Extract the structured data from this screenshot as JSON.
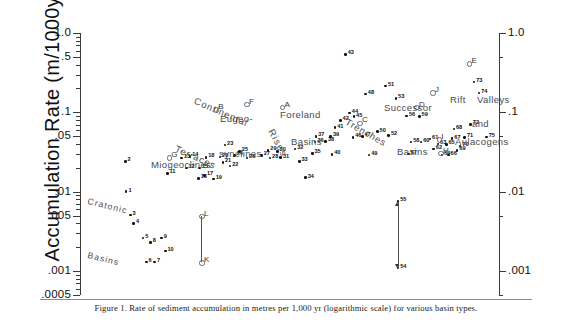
{
  "figure": {
    "caption": "Figure 1. Rate of sediment accumulation in metres per 1,000 yr (logarithmic scale) for various basin types.",
    "ylabel": "Accumulation Rate (m/1000yrs)"
  },
  "chart_data": {
    "type": "scatter",
    "title": "Rate of sediment accumulation in metres per 1,000 yr (logarithmic scale) for various basin types",
    "xlabel": "",
    "ylabel": "Accumulation Rate (m/1000yrs)",
    "yscale": "log",
    "ylim": [
      0.0005,
      1.0
    ],
    "grid": false,
    "legend": "none",
    "xaxis_visible": false,
    "left_axis_ticks": [
      "1.0",
      ".5",
      ".1",
      ".05",
      ".01",
      ".005",
      ".001",
      ".0005"
    ],
    "left_axis_tick_values": [
      1.0,
      0.5,
      0.1,
      0.05,
      0.01,
      0.005,
      0.001,
      0.0005
    ],
    "right_axis_ticks": [
      "1.0",
      ".1",
      ".01",
      ".001"
    ],
    "right_axis_tick_values": [
      1.0,
      0.1,
      0.01,
      0.001
    ],
    "group_labels": [
      {
        "name": "cratonic-basins",
        "text": "Cratonic",
        "text2": "Basins"
      },
      {
        "name": "miogeoclines",
        "text": "Miogeoclines"
      },
      {
        "name": "continental-terraces",
        "text": "Continental",
        "text2": "Terraces"
      },
      {
        "name": "eugeosynclines",
        "text": "Eugeo-",
        "text2": "synclines"
      },
      {
        "name": "rises",
        "text": "Rises"
      },
      {
        "name": "foreland-basins",
        "text": "Foreland",
        "text2": "Basins"
      },
      {
        "name": "trenches",
        "text": "Trenches"
      },
      {
        "name": "successor-basins",
        "text": "Successor",
        "text2": "Basins"
      },
      {
        "name": "rift-valleys-aulacogens",
        "text": "Rift",
        "text2": "Valleys",
        "text3": "and",
        "text4": "Aulacogens"
      }
    ],
    "numbered_points": [
      {
        "id": "1",
        "x": 0.11,
        "y": 0.01
      },
      {
        "id": "2",
        "x": 0.108,
        "y": 0.024
      },
      {
        "id": "3",
        "x": 0.12,
        "y": 0.0051
      },
      {
        "id": "4",
        "x": 0.128,
        "y": 0.004
      },
      {
        "id": "5",
        "x": 0.15,
        "y": 0.0026
      },
      {
        "id": "6",
        "x": 0.158,
        "y": 0.0013
      },
      {
        "id": "7",
        "x": 0.178,
        "y": 0.0013
      },
      {
        "id": "8",
        "x": 0.168,
        "y": 0.0023
      },
      {
        "id": "9",
        "x": 0.194,
        "y": 0.0026
      },
      {
        "id": "10",
        "x": 0.203,
        "y": 0.0018
      },
      {
        "id": "11",
        "x": 0.208,
        "y": 0.017
      },
      {
        "id": "12",
        "x": 0.253,
        "y": 0.02
      },
      {
        "id": "13",
        "x": 0.242,
        "y": 0.0265
      },
      {
        "id": "14",
        "x": 0.262,
        "y": 0.0278
      },
      {
        "id": "15",
        "x": 0.285,
        "y": 0.02
      },
      {
        "id": "16",
        "x": 0.282,
        "y": 0.0148
      },
      {
        "id": "17",
        "x": 0.297,
        "y": 0.016
      },
      {
        "id": "18",
        "x": 0.3,
        "y": 0.0272
      },
      {
        "id": "19",
        "x": 0.318,
        "y": 0.0145
      },
      {
        "id": "20",
        "x": 0.333,
        "y": 0.0275
      },
      {
        "id": "21",
        "x": 0.34,
        "y": 0.0235
      },
      {
        "id": "22",
        "x": 0.357,
        "y": 0.0212
      },
      {
        "id": "23",
        "x": 0.345,
        "y": 0.039
      },
      {
        "id": "24",
        "x": 0.368,
        "y": 0.0285
      },
      {
        "id": "25",
        "x": 0.38,
        "y": 0.032
      },
      {
        "id": "26",
        "x": 0.398,
        "y": 0.0265
      },
      {
        "id": "27",
        "x": 0.432,
        "y": 0.0285
      },
      {
        "id": "28",
        "x": 0.452,
        "y": 0.0265
      },
      {
        "id": "29",
        "x": 0.448,
        "y": 0.033
      },
      {
        "id": "30",
        "x": 0.47,
        "y": 0.032
      },
      {
        "id": "31",
        "x": 0.478,
        "y": 0.0268
      },
      {
        "id": "32",
        "x": 0.512,
        "y": 0.0345
      },
      {
        "id": "33",
        "x": 0.522,
        "y": 0.024
      },
      {
        "id": "34",
        "x": 0.537,
        "y": 0.015
      },
      {
        "id": "35",
        "x": 0.553,
        "y": 0.0305
      },
      {
        "id": "36",
        "x": 0.56,
        "y": 0.0425
      },
      {
        "id": "37",
        "x": 0.562,
        "y": 0.05
      },
      {
        "id": "38",
        "x": 0.585,
        "y": 0.043
      },
      {
        "id": "39",
        "x": 0.597,
        "y": 0.05
      },
      {
        "id": "40",
        "x": 0.6,
        "y": 0.0295
      },
      {
        "id": "41",
        "x": 0.607,
        "y": 0.064
      },
      {
        "id": "42",
        "x": 0.62,
        "y": 0.079
      },
      {
        "id": "43",
        "x": 0.632,
        "y": 0.54
      },
      {
        "id": "44",
        "x": 0.642,
        "y": 0.098
      },
      {
        "id": "45",
        "x": 0.652,
        "y": 0.088
      },
      {
        "id": "46",
        "x": 0.65,
        "y": 0.048
      },
      {
        "id": "47",
        "x": 0.672,
        "y": 0.05
      },
      {
        "id": "48",
        "x": 0.68,
        "y": 0.17
      },
      {
        "id": "49",
        "x": 0.688,
        "y": 0.029
      },
      {
        "id": "50",
        "x": 0.708,
        "y": 0.057
      },
      {
        "id": "51",
        "x": 0.728,
        "y": 0.215
      },
      {
        "id": "52",
        "x": 0.735,
        "y": 0.051
      },
      {
        "id": "53",
        "x": 0.752,
        "y": 0.15
      },
      {
        "id": "54",
        "x": 0.757,
        "y": 0.0011
      },
      {
        "id": "55",
        "x": 0.757,
        "y": 0.0075
      },
      {
        "id": "56",
        "x": 0.778,
        "y": 0.09
      },
      {
        "id": "57",
        "x": 0.782,
        "y": 0.03
      },
      {
        "id": "58",
        "x": 0.788,
        "y": 0.0425
      },
      {
        "id": "59",
        "x": 0.808,
        "y": 0.089
      },
      {
        "id": "60",
        "x": 0.812,
        "y": 0.0425
      },
      {
        "id": "61",
        "x": 0.833,
        "y": 0.046
      },
      {
        "id": "62",
        "x": 0.842,
        "y": 0.0345
      },
      {
        "id": "63",
        "x": 0.852,
        "y": 0.04
      },
      {
        "id": "64",
        "x": 0.862,
        "y": 0.029
      },
      {
        "id": "65",
        "x": 0.872,
        "y": 0.0395
      },
      {
        "id": "66",
        "x": 0.877,
        "y": 0.029
      },
      {
        "id": "67",
        "x": 0.886,
        "y": 0.0465
      },
      {
        "id": "68",
        "x": 0.89,
        "y": 0.062
      },
      {
        "id": "69",
        "x": 0.898,
        "y": 0.033
      },
      {
        "id": "70",
        "x": 0.905,
        "y": 0.0375
      },
      {
        "id": "71",
        "x": 0.916,
        "y": 0.048
      },
      {
        "id": "72",
        "x": 0.93,
        "y": 0.07
      },
      {
        "id": "73",
        "x": 0.938,
        "y": 0.24
      },
      {
        "id": "74",
        "x": 0.95,
        "y": 0.175
      },
      {
        "id": "75",
        "x": 0.968,
        "y": 0.049
      }
    ],
    "lettered_points": [
      {
        "id": "A",
        "x": 0.48,
        "y": 0.118
      },
      {
        "id": "B",
        "x": 0.322,
        "y": 0.11
      },
      {
        "id": "C",
        "x": 0.664,
        "y": 0.075
      },
      {
        "id": "D",
        "x": 0.8,
        "y": 0.118
      },
      {
        "id": "E",
        "x": 0.925,
        "y": 0.42
      },
      {
        "id": "F",
        "x": 0.395,
        "y": 0.129
      },
      {
        "id": "G",
        "x": 0.21,
        "y": 0.0275
      },
      {
        "id": "H",
        "x": 0.857,
        "y": 0.031
      },
      {
        "id": "I",
        "x": 0.853,
        "y": 0.046
      },
      {
        "id": "J",
        "x": 0.838,
        "y": 0.18
      },
      {
        "id": "K",
        "x": 0.288,
        "y": 0.0013
      },
      {
        "id": "L",
        "x": 0.288,
        "y": 0.005
      }
    ],
    "connectors": [
      {
        "name": "connector-K-L",
        "from": "K",
        "to": "L",
        "arrows": "none"
      },
      {
        "name": "connector-54-55",
        "from": "54",
        "to": "55",
        "arrows": "both"
      }
    ]
  }
}
